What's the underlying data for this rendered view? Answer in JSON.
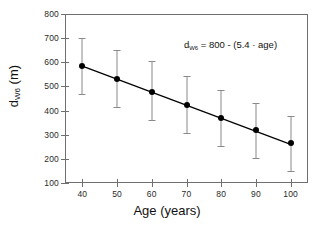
{
  "chart_data": {
    "type": "scatter",
    "title": "",
    "xlabel": "Age (years)",
    "ylabel": "d<sub>W6</sub> (m)",
    "ylabel_main": "d",
    "ylabel_sub": "W6",
    "ylabel_unit": " (m)",
    "xlim": [
      35,
      105
    ],
    "ylim": [
      100,
      800
    ],
    "grid": false,
    "legend": null,
    "xticks": [
      40,
      50,
      60,
      70,
      80,
      90,
      100
    ],
    "xticklabels": [
      "40",
      "50",
      "60",
      "70",
      "80",
      "90",
      "100"
    ],
    "yticks": [
      100,
      200,
      300,
      400,
      500,
      600,
      700,
      800
    ],
    "yticklabels": [
      "100",
      "200",
      "300",
      "400",
      "500",
      "600",
      "700",
      "800"
    ],
    "x": [
      40,
      50,
      60,
      70,
      80,
      90,
      100
    ],
    "values": [
      583,
      532,
      478,
      423,
      371,
      318,
      265
    ],
    "error_lower": [
      467,
      413,
      360,
      307,
      255,
      205,
      150
    ],
    "error_upper": [
      700,
      652,
      605,
      543,
      487,
      432,
      378
    ],
    "points": [
      {
        "age": 40,
        "mean": 583,
        "lower": 467,
        "upper": 700
      },
      {
        "age": 50,
        "mean": 532,
        "lower": 413,
        "upper": 652
      },
      {
        "age": 60,
        "mean": 478,
        "lower": 360,
        "upper": 605
      },
      {
        "age": 70,
        "mean": 423,
        "lower": 307,
        "upper": 543
      },
      {
        "age": 80,
        "mean": 371,
        "lower": 255,
        "upper": 487
      },
      {
        "age": 90,
        "mean": 318,
        "lower": 205,
        "upper": 432
      },
      {
        "age": 100,
        "mean": 265,
        "lower": 150,
        "upper": 378
      }
    ],
    "fit_line": {
      "intercept": 800,
      "slope": -5.4,
      "x_start": 40,
      "x_end": 100,
      "y_start": 584,
      "y_end": 260
    },
    "annotations": [
      {
        "id": "regression-equation",
        "prefix": "d",
        "subscript": "W6",
        "suffix": " = 800 - (5.4 · age)",
        "full_text": "dW6 = 800 - (5.4 · age)"
      }
    ],
    "colors": {
      "marker": "#000000",
      "errorbar": "#8a8a8a",
      "fit_line": "#000000",
      "axis": "#6f6f6f",
      "text": "#111111",
      "background": "#ffffff"
    }
  }
}
